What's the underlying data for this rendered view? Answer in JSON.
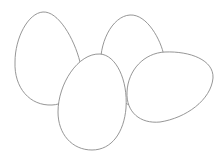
{
  "scene": {
    "description": "Line drawing of four eggs",
    "background_color": "#ffffff",
    "stroke_color": "#8a8a8a",
    "eggs": [
      {
        "id": "egg-back-left",
        "path": "M43,12 C58,11 74,38 80,62 C84,84 72,104 52,105 C30,106 14,88 15,62 C15,38 28,13 43,12 Z"
      },
      {
        "id": "egg-back-right",
        "path": "M130,15 C147,14 161,40 164,56 L150,110 C124,108 104,92 101,70 C98,44 112,16 130,15 Z"
      },
      {
        "id": "egg-right-tilted",
        "path": "M165,52 C190,51 214,60 213,78 C211,100 186,118 160,122 C140,124 126,112 127,92 C128,70 144,53 165,52 Z"
      },
      {
        "id": "egg-front-center",
        "path": "M100,54 C116,55 128,80 126,108 C124,132 112,150 92,150 C72,150 58,134 58,112 C58,84 78,53 100,54 Z"
      }
    ]
  }
}
